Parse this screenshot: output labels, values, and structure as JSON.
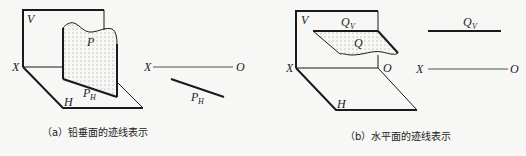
{
  "figure_a": {
    "caption": "（a）铅垂面的迹线表示",
    "labels": {
      "V": "V",
      "X": "X",
      "H": "H",
      "P": "P",
      "PH_main": "P",
      "PH_sub": "H",
      "X2": "X",
      "O2": "O",
      "PH2_main": "P",
      "PH2_sub": "H"
    }
  },
  "figure_b": {
    "caption": "（b）水平面的迹线表示",
    "labels": {
      "V": "V",
      "X": "X",
      "H": "H",
      "O": "O",
      "Q": "Q",
      "QV_main": "Q",
      "QV_sub": "V",
      "X2": "X",
      "O2": "O",
      "QV2_main": "Q",
      "QV2_sub": "V"
    }
  },
  "colors": {
    "line": "#1a1a1a",
    "thin_line": "#555555",
    "dot": "#777777",
    "background": "#f7f7f5"
  }
}
